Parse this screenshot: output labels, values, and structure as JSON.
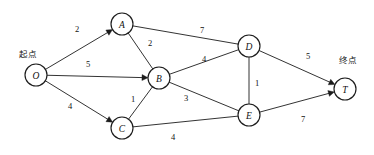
{
  "diagram": {
    "type": "weighted-directed-graph",
    "canvas": {
      "width": 374,
      "height": 155
    },
    "stroke_color": "#1c1c1c",
    "node_fill": "#ffffff",
    "background": "#ffffff",
    "node_radius": 11,
    "annotations": [
      {
        "id": "start",
        "text": "起点",
        "x": 28,
        "y": 54
      },
      {
        "id": "end",
        "text": "终点",
        "x": 348,
        "y": 60
      }
    ],
    "nodes": [
      {
        "id": "O",
        "label": "O",
        "x": 36,
        "y": 75
      },
      {
        "id": "A",
        "label": "A",
        "x": 122,
        "y": 24
      },
      {
        "id": "B",
        "label": "B",
        "x": 159,
        "y": 78
      },
      {
        "id": "C",
        "label": "C",
        "x": 122,
        "y": 128
      },
      {
        "id": "D",
        "label": "D",
        "x": 249,
        "y": 46
      },
      {
        "id": "E",
        "label": "E",
        "x": 249,
        "y": 115
      },
      {
        "id": "T",
        "label": "T",
        "x": 345,
        "y": 89
      }
    ],
    "edges": [
      {
        "id": "O-A",
        "from": "O",
        "to": "A",
        "weight": "2",
        "directed": true,
        "lx": 77,
        "ly": 29
      },
      {
        "id": "O-B",
        "from": "O",
        "to": "B",
        "weight": "5",
        "directed": true,
        "lx": 88,
        "ly": 64
      },
      {
        "id": "O-C",
        "from": "O",
        "to": "C",
        "weight": "4",
        "directed": true,
        "lx": 70,
        "ly": 106
      },
      {
        "id": "A-B",
        "from": "A",
        "to": "B",
        "weight": "2",
        "directed": false,
        "lx": 150,
        "ly": 43
      },
      {
        "id": "A-D",
        "from": "A",
        "to": "D",
        "weight": "7",
        "directed": false,
        "lx": 202,
        "ly": 30
      },
      {
        "id": "B-D",
        "from": "B",
        "to": "D",
        "weight": "4",
        "directed": false,
        "lx": 204,
        "ly": 59
      },
      {
        "id": "B-C",
        "from": "B",
        "to": "C",
        "weight": "1",
        "directed": false,
        "lx": 133,
        "ly": 99
      },
      {
        "id": "B-E",
        "from": "B",
        "to": "E",
        "weight": "3",
        "directed": false,
        "lx": 186,
        "ly": 98
      },
      {
        "id": "C-E",
        "from": "C",
        "to": "E",
        "weight": "4",
        "directed": false,
        "lx": 173,
        "ly": 137
      },
      {
        "id": "D-E",
        "from": "D",
        "to": "E",
        "weight": "1",
        "directed": false,
        "lx": 257,
        "ly": 83
      },
      {
        "id": "D-T",
        "from": "D",
        "to": "T",
        "weight": "5",
        "directed": true,
        "lx": 308,
        "ly": 56
      },
      {
        "id": "E-T",
        "from": "E",
        "to": "T",
        "weight": "7",
        "directed": true,
        "lx": 303,
        "ly": 119
      }
    ]
  }
}
